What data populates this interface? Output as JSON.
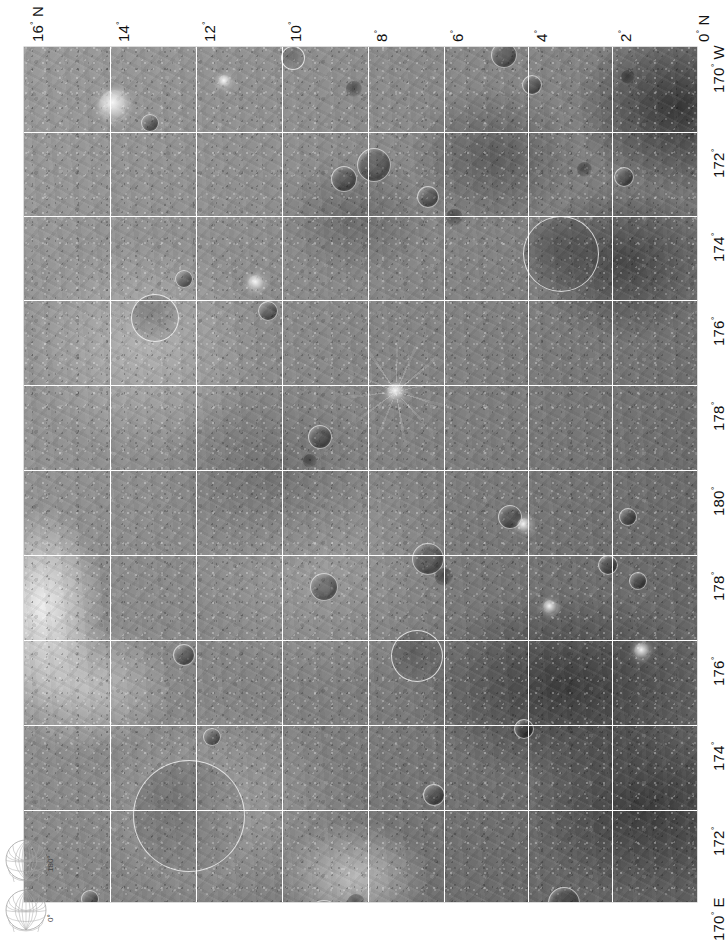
{
  "sheet": {
    "orientation": "rotated-90",
    "body": "Moon",
    "plate_type": "photomosaic"
  },
  "latitude_axis": {
    "name": "latitude-axis-top",
    "unit": "degrees",
    "hemisphere_start": "N",
    "hemisphere_end": "N",
    "ticks": [
      {
        "value": "16",
        "deg": "°",
        "suffix": "N",
        "label": "16° N",
        "x": 24
      },
      {
        "value": "14",
        "deg": "°",
        "suffix": "",
        "label": "14°",
        "x": 110
      },
      {
        "value": "12",
        "deg": "°",
        "suffix": "",
        "label": "12°",
        "x": 196
      },
      {
        "value": "10",
        "deg": "°",
        "suffix": "",
        "label": "10°",
        "x": 282
      },
      {
        "value": "8",
        "deg": "°",
        "suffix": "",
        "label": "8°",
        "x": 368
      },
      {
        "value": "6",
        "deg": "°",
        "suffix": "",
        "label": "6°",
        "x": 444
      },
      {
        "value": "4",
        "deg": "°",
        "suffix": "",
        "label": "4°",
        "x": 528
      },
      {
        "value": "2",
        "deg": "°",
        "suffix": "",
        "label": "2°",
        "x": 612
      },
      {
        "value": "0",
        "deg": "°",
        "suffix": "N",
        "label": "0° N",
        "x": 690
      }
    ]
  },
  "longitude_axis": {
    "name": "longitude-axis-right",
    "unit": "degrees",
    "ticks": [
      {
        "value": "170",
        "deg": "°",
        "suffix": "W",
        "label": "170° W",
        "y": 47
      },
      {
        "value": "172",
        "deg": "°",
        "suffix": "",
        "label": "172°",
        "y": 132
      },
      {
        "value": "174",
        "deg": "°",
        "suffix": "",
        "label": "174°",
        "y": 216
      },
      {
        "value": "176",
        "deg": "°",
        "suffix": "",
        "label": "176°",
        "y": 300
      },
      {
        "value": "178",
        "deg": "°",
        "suffix": "",
        "label": "178°",
        "y": 385
      },
      {
        "value": "180",
        "deg": "°",
        "suffix": "",
        "label": "180°",
        "y": 470
      },
      {
        "value": "178",
        "deg": "°",
        "suffix": "",
        "label": "178°",
        "y": 555
      },
      {
        "value": "176",
        "deg": "°",
        "suffix": "",
        "label": "176°",
        "y": 640
      },
      {
        "value": "174",
        "deg": "°",
        "suffix": "",
        "label": "174°",
        "y": 725
      },
      {
        "value": "172",
        "deg": "°",
        "suffix": "",
        "label": "172°",
        "y": 810
      },
      {
        "value": "170",
        "deg": "°",
        "suffix": "E",
        "label": "170° E",
        "y": 895
      }
    ]
  },
  "graticule": {
    "line_color": "#ffffff",
    "vertical_positions": [
      110,
      196,
      282,
      368,
      444,
      528,
      612
    ],
    "horizontal_positions": [
      85,
      169,
      253,
      338,
      423,
      508,
      593,
      678,
      763
    ]
  },
  "index_globes": [
    {
      "name": "globe-index-180",
      "label": "180°",
      "x": 4,
      "y": 838
    },
    {
      "name": "globe-index-0",
      "label": "0°",
      "x": 4,
      "y": 888
    }
  ],
  "map": {
    "background_color": "#8a8a8a",
    "highlight_color": "#f2f2f2",
    "shadow_color": "#4a4a4a",
    "craters": [
      {
        "x": 268,
        "y": 10,
        "d": 22,
        "style": "cr-ring"
      },
      {
        "x": 330,
        "y": 42,
        "d": 16,
        "style": "cr-dark"
      },
      {
        "x": 480,
        "y": 8,
        "d": 26,
        "style": "cr-rim"
      },
      {
        "x": 508,
        "y": 38,
        "d": 20,
        "style": "cr-rim"
      },
      {
        "x": 604,
        "y": 30,
        "d": 14,
        "style": "cr-dark"
      },
      {
        "x": 90,
        "y": 58,
        "d": 30,
        "style": "cr-bright"
      },
      {
        "x": 126,
        "y": 76,
        "d": 18,
        "style": "cr-rim"
      },
      {
        "x": 200,
        "y": 34,
        "d": 13,
        "style": "cr-bright"
      },
      {
        "x": 350,
        "y": 118,
        "d": 34,
        "style": "cr-rim"
      },
      {
        "x": 320,
        "y": 132,
        "d": 26,
        "style": "cr-rim"
      },
      {
        "x": 404,
        "y": 150,
        "d": 22,
        "style": "cr-rim"
      },
      {
        "x": 430,
        "y": 170,
        "d": 17,
        "style": "cr-dark"
      },
      {
        "x": 536,
        "y": 206,
        "d": 74,
        "style": "cr-ring"
      },
      {
        "x": 600,
        "y": 130,
        "d": 20,
        "style": "cr-rim"
      },
      {
        "x": 560,
        "y": 122,
        "d": 15,
        "style": "cr-dark"
      },
      {
        "x": 130,
        "y": 270,
        "d": 46,
        "style": "cr-ring"
      },
      {
        "x": 160,
        "y": 232,
        "d": 18,
        "style": "cr-rim"
      },
      {
        "x": 232,
        "y": 236,
        "d": 16,
        "style": "cr-bright"
      },
      {
        "x": 244,
        "y": 264,
        "d": 20,
        "style": "cr-rim"
      },
      {
        "x": 372,
        "y": 345,
        "d": 18,
        "style": "cr-bright",
        "rays": 120
      },
      {
        "x": 296,
        "y": 390,
        "d": 24,
        "style": "cr-rim"
      },
      {
        "x": 286,
        "y": 414,
        "d": 14,
        "style": "cr-dark"
      },
      {
        "x": 486,
        "y": 470,
        "d": 24,
        "style": "cr-rim"
      },
      {
        "x": 500,
        "y": 478,
        "d": 14,
        "style": "cr-bright"
      },
      {
        "x": 300,
        "y": 540,
        "d": 28,
        "style": "cr-rim"
      },
      {
        "x": 404,
        "y": 512,
        "d": 32,
        "style": "cr-rim"
      },
      {
        "x": 420,
        "y": 530,
        "d": 18,
        "style": "cr-dark"
      },
      {
        "x": 584,
        "y": 518,
        "d": 20,
        "style": "cr-rim"
      },
      {
        "x": 614,
        "y": 534,
        "d": 18,
        "style": "cr-rim"
      },
      {
        "x": 526,
        "y": 560,
        "d": 14,
        "style": "cr-bright"
      },
      {
        "x": 392,
        "y": 608,
        "d": 50,
        "style": "cr-ring"
      },
      {
        "x": 160,
        "y": 608,
        "d": 22,
        "style": "cr-rim"
      },
      {
        "x": 188,
        "y": 690,
        "d": 18,
        "style": "cr-rim"
      },
      {
        "x": 500,
        "y": 682,
        "d": 20,
        "style": "cr-rim"
      },
      {
        "x": 164,
        "y": 768,
        "d": 110,
        "style": "cr-ring"
      },
      {
        "x": 410,
        "y": 748,
        "d": 22,
        "style": "cr-rim"
      },
      {
        "x": 300,
        "y": 870,
        "d": 34,
        "style": "cr-rim"
      },
      {
        "x": 332,
        "y": 856,
        "d": 18,
        "style": "cr-dark"
      },
      {
        "x": 540,
        "y": 856,
        "d": 32,
        "style": "cr-rim"
      },
      {
        "x": 560,
        "y": 872,
        "d": 16,
        "style": "cr-bright"
      },
      {
        "x": 66,
        "y": 852,
        "d": 18,
        "style": "cr-rim"
      },
      {
        "x": 618,
        "y": 604,
        "d": 16,
        "style": "cr-bright"
      },
      {
        "x": 604,
        "y": 470,
        "d": 18,
        "style": "cr-rim"
      }
    ]
  }
}
